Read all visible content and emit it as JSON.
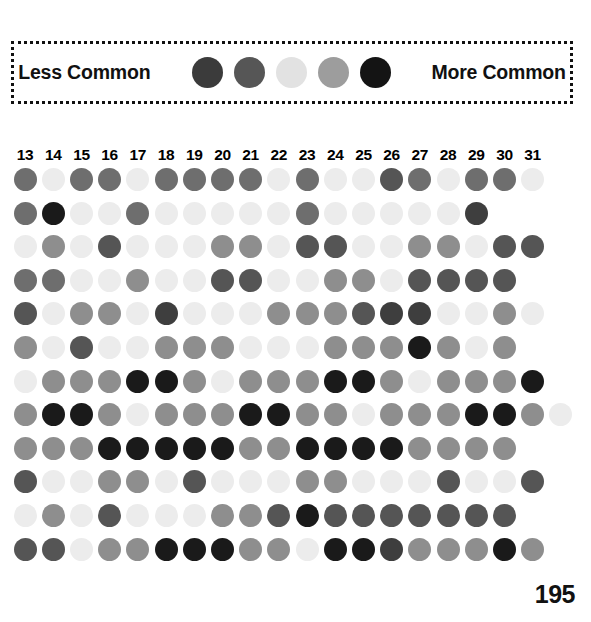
{
  "legend": {
    "low_label": "Less Common",
    "high_label": "More Common",
    "swatches": [
      "#3b3b3b",
      "#565656",
      "#e2e2e2",
      "#9d9d9d",
      "#141414"
    ]
  },
  "page_number": "195",
  "chart_data": {
    "type": "heatmap",
    "title": "",
    "xlabel": "",
    "ylabel": "",
    "legend_position": "top",
    "grid": false,
    "categories": [
      "13",
      "14",
      "15",
      "16",
      "17",
      "18",
      "19",
      "20",
      "21",
      "22",
      "23",
      "24",
      "25",
      "26",
      "27",
      "28",
      "29",
      "30",
      "31"
    ],
    "value_colors": {
      "1": "#ececec",
      "2": "#d8d8d8",
      "3": "#aeaeae",
      "4": "#8e8e8e",
      "5": "#6e6e6e",
      "6": "#555555",
      "7": "#3e3e3e",
      "8": "#1a1a1a"
    },
    "rows": [
      {
        "name": "row-1",
        "values": [
          5,
          1,
          5,
          5,
          1,
          5,
          5,
          5,
          5,
          1,
          5,
          1,
          1,
          6,
          5,
          1,
          5,
          5,
          1
        ]
      },
      {
        "name": "row-2",
        "values": [
          5,
          8,
          1,
          1,
          5,
          1,
          1,
          1,
          1,
          1,
          5,
          1,
          1,
          1,
          1,
          1,
          7,
          null,
          null
        ]
      },
      {
        "name": "row-3",
        "values": [
          1,
          4,
          1,
          6,
          1,
          1,
          1,
          4,
          4,
          1,
          6,
          6,
          1,
          1,
          4,
          4,
          1,
          6,
          6
        ]
      },
      {
        "name": "row-4",
        "values": [
          5,
          5,
          1,
          1,
          4,
          1,
          1,
          6,
          6,
          1,
          1,
          4,
          4,
          1,
          6,
          6,
          6,
          6,
          null
        ]
      },
      {
        "name": "row-5",
        "values": [
          6,
          1,
          4,
          4,
          1,
          7,
          1,
          1,
          1,
          4,
          4,
          4,
          6,
          7,
          7,
          1,
          1,
          4,
          1
        ]
      },
      {
        "name": "row-6",
        "values": [
          4,
          1,
          6,
          1,
          1,
          4,
          4,
          4,
          1,
          1,
          1,
          4,
          4,
          4,
          8,
          4,
          1,
          4,
          null
        ]
      },
      {
        "name": "row-7",
        "values": [
          1,
          4,
          4,
          4,
          8,
          8,
          4,
          1,
          4,
          4,
          4,
          8,
          8,
          4,
          1,
          4,
          4,
          4,
          8
        ]
      },
      {
        "name": "row-8",
        "values": [
          4,
          8,
          8,
          4,
          1,
          4,
          4,
          4,
          8,
          8,
          4,
          4,
          1,
          4,
          4,
          4,
          8,
          8,
          4,
          1
        ]
      },
      {
        "name": "row-9",
        "values": [
          4,
          4,
          4,
          8,
          8,
          8,
          8,
          8,
          4,
          4,
          8,
          8,
          8,
          8,
          4,
          4,
          4,
          4,
          null
        ]
      },
      {
        "name": "row-10",
        "values": [
          6,
          1,
          1,
          4,
          4,
          1,
          6,
          1,
          1,
          1,
          4,
          4,
          1,
          1,
          1,
          6,
          1,
          1,
          6
        ]
      },
      {
        "name": "row-11",
        "values": [
          1,
          4,
          1,
          6,
          1,
          1,
          1,
          4,
          4,
          6,
          8,
          6,
          6,
          6,
          6,
          6,
          6,
          6,
          null
        ]
      },
      {
        "name": "row-12",
        "values": [
          6,
          6,
          1,
          4,
          4,
          8,
          8,
          8,
          4,
          4,
          1,
          8,
          8,
          7,
          4,
          4,
          4,
          8,
          4
        ]
      }
    ]
  }
}
